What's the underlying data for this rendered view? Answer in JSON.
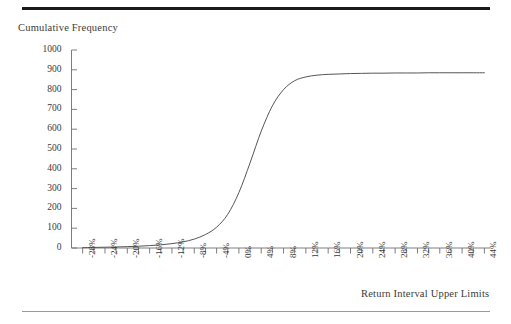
{
  "figure": {
    "y_axis_title": "Cumulative Frequency",
    "x_axis_title": "Return Interval Upper Limits"
  },
  "chart_data": {
    "type": "line",
    "title": "",
    "subtitle": "",
    "xlabel": "Return Interval Upper Limits",
    "ylabel": "Cumulative Frequency",
    "xlim": [
      -30,
      45
    ],
    "ylim": [
      0,
      1000
    ],
    "grid": false,
    "legend": null,
    "y_ticks": [
      0,
      100,
      200,
      300,
      400,
      500,
      600,
      700,
      800,
      900,
      1000
    ],
    "y_tick_labels": [
      "0",
      "100",
      "200",
      "300",
      "400",
      "500",
      "600",
      "700",
      "800",
      "900",
      "1000"
    ],
    "x_ticks": [
      -28,
      -26,
      -24,
      -22,
      -20,
      -18,
      -16,
      -14,
      -12,
      -10,
      -8,
      -6,
      -4,
      -2,
      0,
      2,
      4,
      6,
      8,
      10,
      12,
      14,
      16,
      18,
      20,
      22,
      24,
      26,
      28,
      30,
      32,
      34,
      36,
      38,
      40,
      42,
      44
    ],
    "x_tick_labels": [
      "-28%",
      "",
      "-24%",
      "",
      "-20%",
      "",
      "-16%",
      "",
      "-12%",
      "",
      "-8%",
      "",
      "-4%",
      "",
      "0%",
      "",
      "4%",
      "",
      "8%",
      "",
      "12%",
      "",
      "16%",
      "",
      "20%",
      "",
      "24%",
      "",
      "28%",
      "",
      "32%",
      "",
      "36%",
      "",
      "40%",
      "",
      "44%"
    ],
    "x": [
      -28,
      -26,
      -24,
      -22,
      -20,
      -18,
      -16,
      -14,
      -12,
      -10,
      -8,
      -6,
      -4,
      -2,
      0,
      2,
      4,
      6,
      8,
      10,
      12,
      14,
      16,
      18,
      20,
      22,
      24,
      26,
      28,
      30,
      32,
      34,
      36,
      38,
      40,
      42,
      44
    ],
    "values": [
      2,
      3,
      4,
      5,
      7,
      9,
      12,
      16,
      22,
      31,
      45,
      68,
      105,
      170,
      280,
      430,
      590,
      718,
      800,
      845,
      864,
      873,
      877,
      879,
      881,
      882,
      883,
      883,
      884,
      884,
      884,
      885,
      885,
      885,
      885,
      885,
      885
    ],
    "series": [
      {
        "name": "Cumulative Frequency",
        "values": [
          2,
          3,
          4,
          5,
          7,
          9,
          12,
          16,
          22,
          31,
          45,
          68,
          105,
          170,
          280,
          430,
          590,
          718,
          800,
          845,
          864,
          873,
          877,
          879,
          881,
          882,
          883,
          883,
          884,
          884,
          884,
          885,
          885,
          885,
          885,
          885,
          885
        ]
      }
    ],
    "line_color": "#555555",
    "plateau_value": 885,
    "total_observations": 885
  }
}
